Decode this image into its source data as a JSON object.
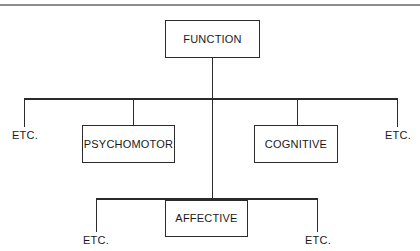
{
  "page": {
    "background_color": "#ffffff",
    "rule_color": "#8d8d8d",
    "line_color": "#2b2b2b",
    "text_color": "#1a1a1a"
  },
  "diagram": {
    "root": {
      "label": "FUNCTION"
    },
    "level2": [
      {
        "label": "ETC.",
        "type": "leaf"
      },
      {
        "label": "PSYCHOMOTOR",
        "type": "box"
      },
      {
        "label": "AFFECTIVE",
        "type": "box"
      },
      {
        "label": "COGNITIVE",
        "type": "box"
      },
      {
        "label": "ETC.",
        "type": "leaf"
      }
    ],
    "level3": [
      {
        "label": "ETC.",
        "type": "leaf",
        "parent": "AFFECTIVE"
      },
      {
        "label": "ETC.",
        "type": "leaf",
        "parent": "AFFECTIVE"
      }
    ],
    "nodes": {
      "function": "FUNCTION",
      "psychomotor": "PSYCHOMOTOR",
      "cognitive": "COGNITIVE",
      "affective": "AFFECTIVE",
      "etc_far_left": "ETC.",
      "etc_far_right": "ETC.",
      "etc_bottom_left": "ETC.",
      "etc_bottom_right": "ETC."
    }
  }
}
